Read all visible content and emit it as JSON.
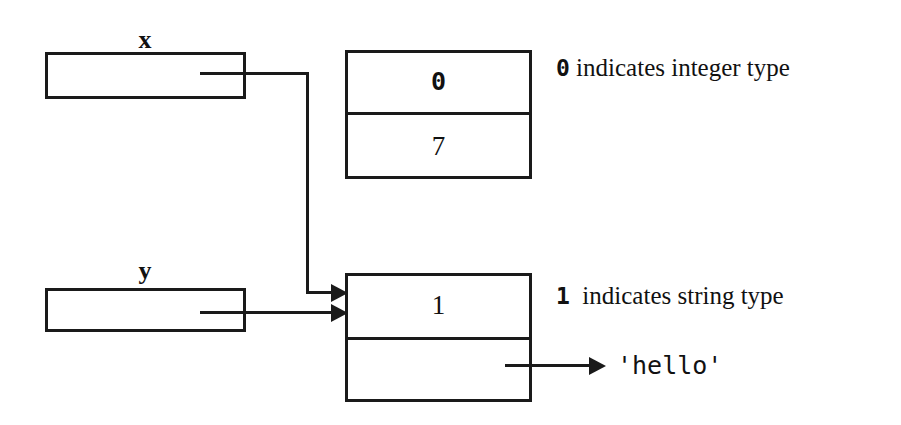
{
  "diagram": {
    "stroke_color": "#1a1a1a",
    "background_color": "#ffffff",
    "variables": [
      {
        "name": "x",
        "label": "x"
      },
      {
        "name": "y",
        "label": "y"
      }
    ],
    "objects": [
      {
        "name": "integer-object",
        "type_tag": "0",
        "value": "7",
        "annotation_tag": "0",
        "annotation_text": " indicates integer type"
      },
      {
        "name": "string-object",
        "type_tag": "1",
        "value": "",
        "annotation_tag": "1",
        "annotation_text": "  indicates string type",
        "value_label": "'hello'"
      }
    ],
    "annotations": {
      "integer_note_tag": "0",
      "integer_note_text": " indicates integer type",
      "string_note_tag": "1",
      "string_note_text": "  indicates string type",
      "string_value": "'hello'"
    }
  }
}
